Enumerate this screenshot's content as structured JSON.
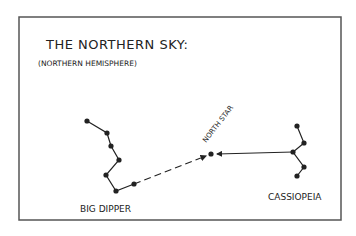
{
  "diagram": {
    "title": "THE NORTHERN SKY:",
    "subtitle": "(NORTHERN HEMISPHERE)",
    "frame": {
      "x": 19,
      "y": 17,
      "width": 322,
      "height": 203,
      "color": "#555555"
    },
    "ink_color": "#222222",
    "constellations": [
      {
        "name": "BIG DIPPER",
        "label_pos": [
          80,
          212
        ],
        "stars": [
          [
            87,
            121
          ],
          [
            107,
            133
          ],
          [
            111,
            146
          ],
          [
            119,
            160
          ],
          [
            106,
            175
          ],
          [
            116,
            191
          ],
          [
            134,
            184
          ]
        ]
      },
      {
        "name": "CASSIOPEIA",
        "label_pos": [
          268,
          200
        ],
        "stars": [
          [
            297,
            126
          ],
          [
            304,
            143
          ],
          [
            293,
            152
          ],
          [
            304,
            167
          ],
          [
            297,
            176
          ]
        ]
      }
    ],
    "north_star": {
      "label": "NORTH STAR",
      "position": [
        211,
        154
      ],
      "label_pos": [
        206,
        143
      ],
      "label_rotation": -52
    },
    "arrows": [
      {
        "from": "BIG DIPPER",
        "to": "NORTH STAR",
        "style": "dashed",
        "start": [
          134,
          184
        ],
        "end": [
          206,
          156
        ]
      },
      {
        "from": "CASSIOPEIA",
        "to": "NORTH STAR",
        "style": "solid",
        "start": [
          293,
          152
        ],
        "end": [
          217,
          154
        ]
      }
    ]
  }
}
